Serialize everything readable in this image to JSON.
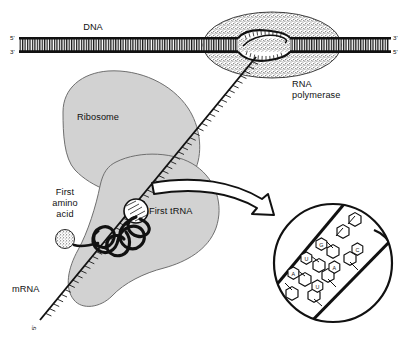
{
  "figure": {
    "background_color": "#ffffff",
    "ink_color": "#1a1a1a",
    "ribosome_fill": "#d2d2d2",
    "polymerase_fill": "#d8d8d8"
  },
  "dna": {
    "label": "DNA",
    "left_top_prime": "5'",
    "left_bottom_prime": "3'",
    "right_top_prime": "3'",
    "right_bottom_prime": "5'"
  },
  "polymerase": {
    "label_line1": "RNA",
    "label_line2": "polymerase"
  },
  "ribosome": {
    "label": "Ribosome"
  },
  "amino_acid": {
    "label_line1": "First",
    "label_line2": "amino",
    "label_line3": "acid"
  },
  "trna": {
    "label": "First tRNA"
  },
  "mrna": {
    "label": "mRNA",
    "end_prime": "5'"
  },
  "inset": {
    "bases": [
      "U",
      "G",
      "A",
      "A",
      "C",
      "U"
    ]
  }
}
